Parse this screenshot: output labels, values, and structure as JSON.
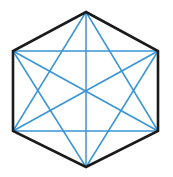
{
  "figure": {
    "name": "hexagon-with-all-diagonals",
    "type": "geometric-diagram",
    "background_color": "#ffffff",
    "width": 173,
    "height": 177,
    "outline_color": "#1a1a1a",
    "outline_width": 2.6,
    "diagonal_color": "#3a95d5",
    "diagonal_width": 1.5,
    "shape_label": "regular hexagon",
    "vertex_count": 6,
    "diagonal_count": 9,
    "vertices": [
      {
        "id": "top",
        "label": "A",
        "x": 86,
        "y": 12
      },
      {
        "id": "top-right",
        "label": "B",
        "x": 158,
        "y": 51
      },
      {
        "id": "bottom-right",
        "label": "C",
        "x": 158,
        "y": 131
      },
      {
        "id": "bottom",
        "label": "D",
        "x": 86,
        "y": 167
      },
      {
        "id": "bottom-left",
        "label": "E",
        "x": 13,
        "y": 131
      },
      {
        "id": "top-left",
        "label": "F",
        "x": 13,
        "y": 51
      }
    ],
    "edges": [
      {
        "id": "edge-ab",
        "from": "top",
        "to": "top-right",
        "x1": 86,
        "y1": 12,
        "x2": 158,
        "y2": 51
      },
      {
        "id": "edge-bc",
        "from": "top-right",
        "to": "bottom-right",
        "x1": 158,
        "y1": 51,
        "x2": 158,
        "y2": 131
      },
      {
        "id": "edge-cd",
        "from": "bottom-right",
        "to": "bottom",
        "x1": 158,
        "y1": 131,
        "x2": 86,
        "y2": 167
      },
      {
        "id": "edge-de",
        "from": "bottom",
        "to": "bottom-left",
        "x1": 86,
        "y1": 167,
        "x2": 13,
        "y2": 131
      },
      {
        "id": "edge-ef",
        "from": "bottom-left",
        "to": "top-left",
        "x1": 13,
        "y1": 131,
        "x2": 13,
        "y2": 51
      },
      {
        "id": "edge-fa",
        "from": "top-left",
        "to": "top",
        "x1": 13,
        "y1": 51,
        "x2": 86,
        "y2": 12
      }
    ],
    "diagonals": [
      {
        "id": "diag-ad",
        "from": "top",
        "to": "bottom",
        "kind": "long",
        "x1": 86,
        "y1": 12,
        "x2": 86,
        "y2": 167
      },
      {
        "id": "diag-be",
        "from": "top-right",
        "to": "bottom-left",
        "kind": "long",
        "x1": 158,
        "y1": 51,
        "x2": 13,
        "y2": 131
      },
      {
        "id": "diag-cf",
        "from": "bottom-right",
        "to": "top-left",
        "kind": "long",
        "x1": 158,
        "y1": 131,
        "x2": 13,
        "y2": 51
      },
      {
        "id": "diag-ac",
        "from": "top",
        "to": "bottom-right",
        "kind": "short",
        "x1": 86,
        "y1": 12,
        "x2": 158,
        "y2": 131
      },
      {
        "id": "diag-ae",
        "from": "top",
        "to": "bottom-left",
        "kind": "short",
        "x1": 86,
        "y1": 12,
        "x2": 13,
        "y2": 131
      },
      {
        "id": "diag-bd",
        "from": "top-right",
        "to": "bottom",
        "kind": "short",
        "x1": 158,
        "y1": 51,
        "x2": 86,
        "y2": 167
      },
      {
        "id": "diag-bf",
        "from": "top-right",
        "to": "top-left",
        "kind": "short",
        "x1": 158,
        "y1": 51,
        "x2": 13,
        "y2": 51
      },
      {
        "id": "diag-ce",
        "from": "bottom-right",
        "to": "bottom-left",
        "kind": "short",
        "x1": 158,
        "y1": 131,
        "x2": 13,
        "y2": 131
      },
      {
        "id": "diag-df",
        "from": "bottom",
        "to": "top-left",
        "kind": "short",
        "x1": 86,
        "y1": 167,
        "x2": 13,
        "y2": 51
      }
    ]
  }
}
